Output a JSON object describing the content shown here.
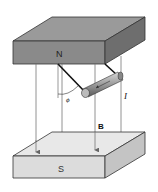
{
  "diagram": {
    "north_pole_label": "N",
    "south_pole_label": "S",
    "field_label": "B",
    "current_label": "I",
    "angle_label": "ϕ",
    "colors": {
      "north_top": "#9a9a9a",
      "north_front": "#8a8a8a",
      "north_side": "#6e6e6e",
      "south_top": "#e8e8e8",
      "south_front": "#dcdcdc",
      "south_side": "#c4c4c4",
      "field_lines": "#777777",
      "wire": "#111111",
      "rod": "#9c9c9c"
    }
  }
}
